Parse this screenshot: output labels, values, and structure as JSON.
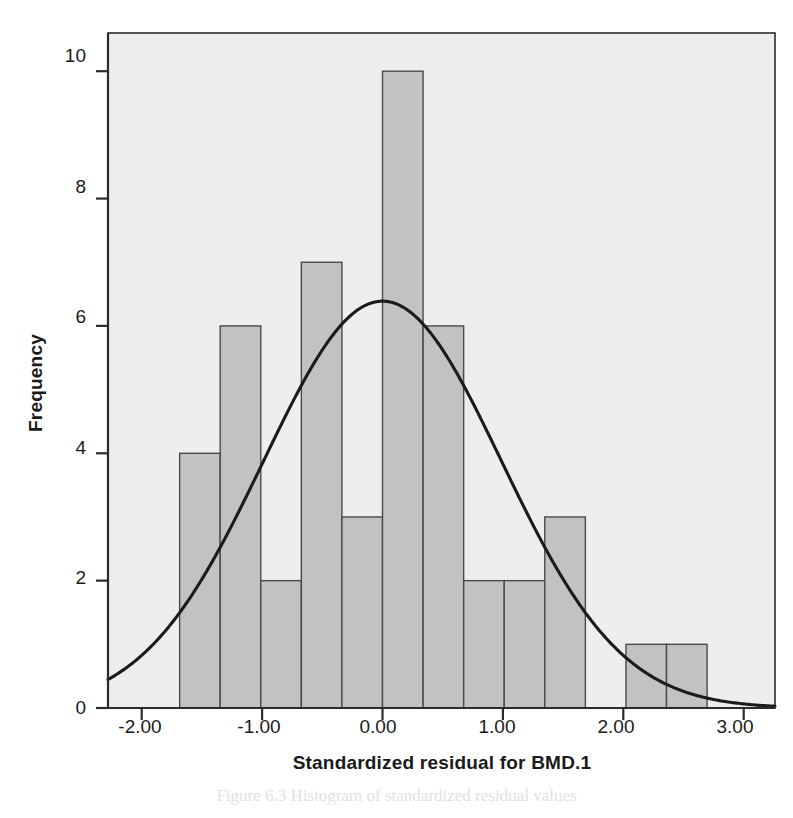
{
  "chart_data": {
    "type": "bar",
    "title": "",
    "xlabel": "Standardized residual for BMD.1",
    "ylabel": "Frequency",
    "xlim": [
      -2.28,
      3.26
    ],
    "ylim": [
      0,
      10.6
    ],
    "grid": false,
    "legend": null,
    "bin_width": 0.337,
    "bin_left_edges": [
      -1.685,
      -1.348,
      -1.011,
      -0.674,
      -0.337,
      0.0,
      0.337,
      0.674,
      1.011,
      1.348,
      1.685,
      2.022,
      2.359
    ],
    "categories": [
      "-1.69 to -1.35",
      "-1.35 to -1.01",
      "-1.01 to -0.67",
      "-0.67 to -0.34",
      "-0.34 to 0.00",
      "0.00 to 0.34",
      "0.34 to 0.67",
      "0.67 to 1.01",
      "1.01 to 1.35",
      "1.35 to 1.69",
      "1.69 to 2.02",
      "2.02 to 2.36",
      "2.36 to 2.70"
    ],
    "values": [
      4,
      6,
      2,
      7,
      3,
      10,
      6,
      2,
      2,
      3,
      0,
      1,
      1
    ],
    "xticks": [
      -2.0,
      -1.0,
      0.0,
      1.0,
      2.0,
      3.0
    ],
    "xtick_labels": [
      "-2.00",
      "-1.00",
      "0.00",
      "1.00",
      "2.00",
      "3.00"
    ],
    "yticks": [
      0,
      2,
      4,
      6,
      8,
      10
    ],
    "ytick_labels": [
      "0",
      "2",
      "4",
      "6",
      "8",
      "10"
    ],
    "normal_curve": {
      "mean": 0.0,
      "std_dev": 0.989,
      "n": 47,
      "peak_value": 6.3,
      "description": "normal distribution overlay scaled to counts"
    },
    "annotations": {
      "mean_label": "Mean = 7.17E-15",
      "std_dev_label": "Std. Dev. = 0.989",
      "n_symbol": "N",
      "n_value": "= 47"
    },
    "colors": {
      "bar_fill": "#c2c2c2",
      "bar_stroke": "#4a4a4a",
      "plot_background": "#eeeeee",
      "curve": "#1b1b1b",
      "axis": "#2b2b2b",
      "text": "#161616"
    }
  },
  "caption": {
    "text": "Figure 6.3  Histogram of standardized residual values"
  }
}
